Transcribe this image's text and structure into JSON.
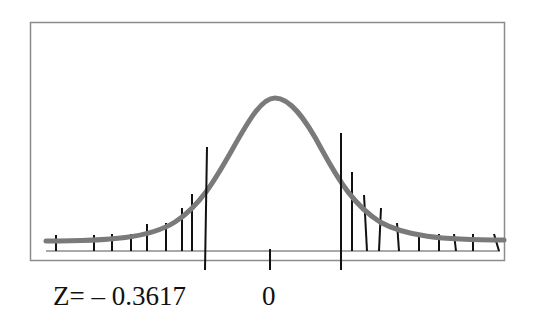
{
  "figure": {
    "type": "normal-distribution-diagram",
    "labels": {
      "left_z": "Z= – 0.3617",
      "center": "0"
    },
    "colors": {
      "curve": "#7a7a7a",
      "frame": "#8c8c8c",
      "lines": "#111111",
      "baseline": "#8c8c8c"
    }
  }
}
